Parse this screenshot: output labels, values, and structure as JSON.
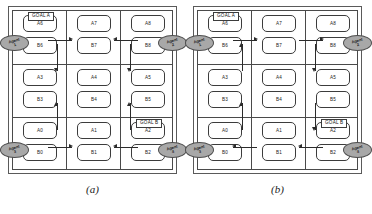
{
  "figure": {
    "panels": [
      {
        "id": "a",
        "caption": "(a)",
        "goal_tags": [
          {
            "name": "goal-a",
            "label": "GOAL A",
            "cell": "top-left"
          },
          {
            "name": "goal-b",
            "label": "GOAL B",
            "cell": "bottom-right"
          }
        ],
        "cells": [
          {
            "row": 0,
            "col": 0,
            "nodes": [
              "A6",
              "B6"
            ]
          },
          {
            "row": 0,
            "col": 1,
            "nodes": [
              "A7",
              "B7"
            ]
          },
          {
            "row": 0,
            "col": 2,
            "nodes": [
              "A8",
              "B8"
            ]
          },
          {
            "row": 1,
            "col": 0,
            "nodes": [
              "A3",
              "B3"
            ]
          },
          {
            "row": 1,
            "col": 1,
            "nodes": [
              "A4",
              "B4"
            ]
          },
          {
            "row": 1,
            "col": 2,
            "nodes": [
              "A5",
              "B5"
            ]
          },
          {
            "row": 2,
            "col": 0,
            "nodes": [
              "A0",
              "B0"
            ]
          },
          {
            "row": 2,
            "col": 1,
            "nodes": [
              "A1",
              "B1"
            ]
          },
          {
            "row": 2,
            "col": 2,
            "nodes": [
              "A2",
              "B2"
            ]
          }
        ],
        "agents": [
          {
            "label": "Agent\n1",
            "position": "top-left-edge"
          },
          {
            "label": "Agent\n2",
            "position": "top-right-edge"
          },
          {
            "label": "Agent\n3",
            "position": "bottom-left-edge"
          },
          {
            "label": "Agent\n4",
            "position": "bottom-right-edge"
          }
        ],
        "arrows": [
          {
            "name": "arrow-top-left-right",
            "direction": "right"
          },
          {
            "name": "arrow-top-right-left",
            "direction": "left"
          },
          {
            "name": "arrow-mid-left-down",
            "direction": "down"
          },
          {
            "name": "arrow-mid-right-down",
            "direction": "down"
          },
          {
            "name": "arrow-low-left-up",
            "direction": "up"
          },
          {
            "name": "arrow-low-right-up",
            "direction": "up"
          },
          {
            "name": "arrow-bottom-left-right",
            "direction": "right"
          },
          {
            "name": "arrow-bottom-right-left",
            "direction": "left"
          }
        ]
      },
      {
        "id": "b",
        "caption": "(b)",
        "goal_tags": [
          {
            "name": "goal-a",
            "label": "GOAL A",
            "cell": "top-left"
          },
          {
            "name": "goal-b",
            "label": "GOAL B",
            "cell": "bottom-right"
          }
        ],
        "cells": [
          {
            "row": 0,
            "col": 0,
            "nodes": [
              "A6",
              "B6"
            ]
          },
          {
            "row": 0,
            "col": 1,
            "nodes": [
              "A7",
              "B7"
            ]
          },
          {
            "row": 0,
            "col": 2,
            "nodes": [
              "A8",
              "B8"
            ]
          },
          {
            "row": 1,
            "col": 0,
            "nodes": [
              "A3",
              "B3"
            ]
          },
          {
            "row": 1,
            "col": 1,
            "nodes": [
              "A4",
              "B4"
            ]
          },
          {
            "row": 1,
            "col": 2,
            "nodes": [
              "A5",
              "B5"
            ]
          },
          {
            "row": 2,
            "col": 0,
            "nodes": [
              "A0",
              "B0"
            ]
          },
          {
            "row": 2,
            "col": 1,
            "nodes": [
              "A1",
              "B1"
            ]
          },
          {
            "row": 2,
            "col": 2,
            "nodes": [
              "A2",
              "B2"
            ]
          }
        ],
        "agents": [
          {
            "label": "Agent\n1",
            "position": "top-left-edge"
          },
          {
            "label": "Agent\n2",
            "position": "top-right-edge"
          },
          {
            "label": "Agent\n3",
            "position": "bottom-left-edge"
          },
          {
            "label": "Agent\n4",
            "position": "bottom-right-edge"
          }
        ],
        "arrows": [
          {
            "name": "arrow-top-left-right",
            "direction": "right"
          },
          {
            "name": "arrow-top-right-right",
            "direction": "right"
          },
          {
            "name": "arrow-mid-left-up",
            "direction": "up"
          },
          {
            "name": "arrow-mid-right-down",
            "direction": "down"
          },
          {
            "name": "arrow-low-left-up",
            "direction": "up"
          },
          {
            "name": "arrow-low-right-down",
            "direction": "down"
          },
          {
            "name": "arrow-bottom-left-left",
            "direction": "left"
          },
          {
            "name": "arrow-bottom-right-left",
            "direction": "left"
          }
        ]
      }
    ],
    "colors": {
      "agent_fill": "#a8a8a8",
      "line": "#4a4a4a",
      "arrow": "#2b2b2b",
      "node_border": "#3c3c3c",
      "background": "#ffffff"
    }
  }
}
